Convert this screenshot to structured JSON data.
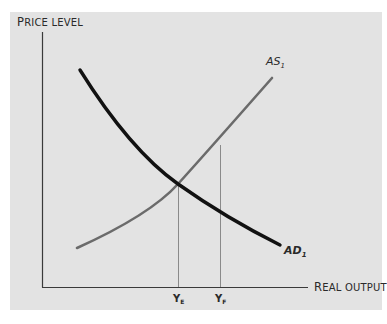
{
  "diagram": {
    "type": "aggregate-demand-aggregate-supply",
    "y_axis_label": "Price level",
    "x_axis_label": "Real output",
    "curves": [
      {
        "name": "AS",
        "subscript": "1",
        "color": "#6b6b6b",
        "style": "regular"
      },
      {
        "name": "AD",
        "subscript": "1",
        "color": "#111111",
        "style": "bold-italic"
      }
    ],
    "x_markers": [
      {
        "label": "Y",
        "subscript": "E",
        "meaning": "equilibrium output"
      },
      {
        "label": "Y",
        "subscript": "F",
        "meaning": "full-employment output"
      }
    ],
    "colors": {
      "panel": "#e3e3e3",
      "axis": "#3a3a3a",
      "guide": "#8a8a8a"
    }
  }
}
